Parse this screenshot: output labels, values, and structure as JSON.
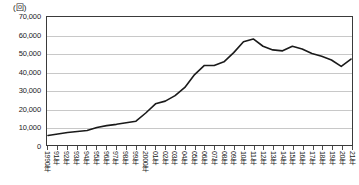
{
  "chart_data": {
    "type": "line",
    "title": "",
    "subtitle": "",
    "unit_label": "(回)",
    "xlabel": "",
    "ylabel": "",
    "ylim": [
      0,
      70000
    ],
    "ytick_labels": [
      "70,000",
      "60,000",
      "50,000",
      "40,000",
      "30,000",
      "20,000",
      "10,000",
      "0"
    ],
    "ytick_values": [
      70000,
      60000,
      50000,
      40000,
      30000,
      20000,
      10000,
      0
    ],
    "grid": true,
    "legend": false,
    "legend_position": "none",
    "line_color": "#1a1a1a",
    "grid_color": "#c8c8c8",
    "axis_color": "#3a3a3a",
    "categories": [
      "1990年",
      "91年",
      "92年",
      "93年",
      "94年",
      "95年",
      "96年",
      "97年",
      "98年",
      "99年",
      "2000年",
      "01年",
      "02年",
      "03年",
      "04年",
      "05年",
      "06年",
      "07年",
      "08年",
      "09年",
      "10年",
      "11年",
      "12年",
      "13年",
      "14年",
      "15年",
      "16年",
      "17年",
      "18年",
      "19年",
      "20年",
      "21年"
    ],
    "values": [
      5200,
      6000,
      6800,
      7400,
      7900,
      9600,
      10600,
      11300,
      12200,
      13000,
      17500,
      22500,
      24000,
      27000,
      31500,
      38500,
      43500,
      43500,
      45500,
      50500,
      56500,
      58000,
      54000,
      52000,
      51500,
      54000,
      52500,
      50000,
      48500,
      46500,
      43000,
      47000
    ],
    "series_name": ""
  }
}
